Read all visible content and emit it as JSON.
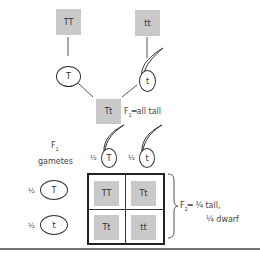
{
  "parents": {
    "p1": {
      "genotype": "TT"
    },
    "p2": {
      "genotype": "tt"
    }
  },
  "parent_gametes": {
    "g1": {
      "allele": "T",
      "shape": "egg"
    },
    "g2": {
      "allele": "t",
      "shape": "pollen"
    }
  },
  "f1": {
    "genotype": "Tt",
    "label_prefix": "F",
    "label_sub": "1",
    "label_suffix": "═all tall"
  },
  "f1_gametes": {
    "title_line1": "F",
    "title_sub": "1",
    "title_line2": "gametes",
    "columns": [
      {
        "fraction": "½",
        "allele": "T"
      },
      {
        "fraction": "½",
        "allele": "t"
      }
    ],
    "rows": [
      {
        "fraction": "½",
        "allele": "T"
      },
      {
        "fraction": "½",
        "allele": "t"
      }
    ]
  },
  "punnett": {
    "cells": [
      [
        "TT",
        "Tt"
      ],
      [
        "Tt",
        "tt"
      ]
    ]
  },
  "f2": {
    "label_prefix": "F",
    "label_sub": "2",
    "line1": "═ ¾ tall,",
    "line2": "¼ dwarf"
  }
}
